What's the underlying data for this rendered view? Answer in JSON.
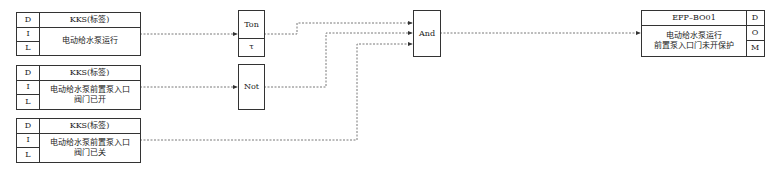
{
  "inputs": [
    {
      "d": "D",
      "i": "I",
      "l": "L",
      "tag": "KKS(标签)",
      "desc": "电动给水泵运行"
    },
    {
      "d": "D",
      "i": "I",
      "l": "L",
      "tag": "KKS(标签)",
      "desc": "电动给水泵前置泵入口\n阀门已开"
    },
    {
      "d": "D",
      "i": "I",
      "l": "L",
      "tag": "KKS(标签)",
      "desc": "电动给水泵前置泵入口\n阀门已关"
    }
  ],
  "blocks": {
    "ton": {
      "label": "Ton",
      "param": "τ"
    },
    "not": {
      "label": "Not"
    },
    "and": {
      "label": "And"
    }
  },
  "output": {
    "tag": "EFP–BO01",
    "desc": "电动给水泵运行\n前置泵入口门未开保护",
    "d": "D",
    "o": "O",
    "m": "M"
  }
}
